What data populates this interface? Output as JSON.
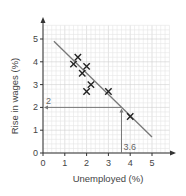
{
  "chart_data": {
    "type": "scatter",
    "title": "",
    "xlabel": "Unemployed (%)",
    "ylabel": "Rise in wages (%)",
    "xlim": [
      0,
      5.8
    ],
    "ylim": [
      0,
      5.6
    ],
    "x_ticks": [
      0,
      1,
      2,
      3,
      4,
      5
    ],
    "y_ticks": [
      0,
      1,
      2,
      3,
      4,
      5
    ],
    "grid": true,
    "legend": null,
    "series": [
      {
        "name": "data",
        "marker": "x",
        "points": [
          {
            "x": 1.4,
            "y": 3.9
          },
          {
            "x": 1.6,
            "y": 4.2
          },
          {
            "x": 1.8,
            "y": 3.5
          },
          {
            "x": 2.0,
            "y": 3.8
          },
          {
            "x": 2.0,
            "y": 2.7
          },
          {
            "x": 2.2,
            "y": 3.0
          },
          {
            "x": 3.0,
            "y": 2.7
          },
          {
            "x": 4.0,
            "y": 1.6
          }
        ]
      }
    ],
    "best_fit_line": {
      "x1": 0.5,
      "y1": 4.9,
      "x2": 5.0,
      "y2": 0.7
    },
    "annotations": [
      {
        "type": "read-off",
        "x": 3.6,
        "y": 2,
        "x_label": "3.6",
        "y_label": "2"
      }
    ]
  },
  "labels": {
    "xlabel": "Unemployed (%)",
    "ylabel": "Rise in wages (%)",
    "annot_x": "3.6",
    "annot_y": "2"
  },
  "colors": {
    "grid_minor": "#e6e6e6",
    "grid_major": "#cfcfcf",
    "axis": "#333333",
    "fit_line": "#777777",
    "marker": "#222222",
    "annotation": "#777777"
  }
}
